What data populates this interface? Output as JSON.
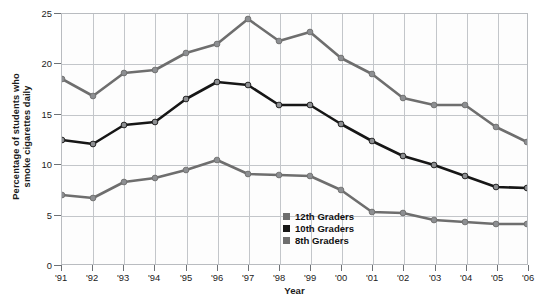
{
  "chart_data": {
    "type": "line",
    "title": "",
    "xlabel": "Year",
    "ylabel_line1": "Percentage of students who",
    "ylabel_line2": "smoke cigarettes daily",
    "ylabel": "Percentage of students who smoke cigarettes daily",
    "categories": [
      "'91",
      "'92",
      "'93",
      "'94",
      "'95",
      "'96",
      "'97",
      "'98",
      "'99",
      "'00",
      "'01",
      "'02",
      "'03",
      "'04",
      "'05",
      "'06"
    ],
    "xticklabels": [
      "'91",
      "'92",
      "'93",
      "'94",
      "'95",
      "'96",
      "'97",
      "'98",
      "'99",
      "'00",
      "'01",
      "'02",
      "'03",
      "'04",
      "'05",
      "'06"
    ],
    "yticklabels": [
      "0",
      "5",
      "10",
      "15",
      "20",
      "25"
    ],
    "yticks": [
      0,
      5,
      10,
      15,
      20,
      25
    ],
    "ylim": [
      0,
      25
    ],
    "grid": true,
    "legend_position": "inside-bottom-center",
    "series": [
      {
        "name": "12th Graders",
        "color": "#6e6e6e",
        "values": [
          18.5,
          16.8,
          19.1,
          19.4,
          21.1,
          22.0,
          24.5,
          22.3,
          23.2,
          20.6,
          19.0,
          16.6,
          15.9,
          15.9,
          13.7,
          12.2
        ]
      },
      {
        "name": "10th Graders",
        "color": "#161616",
        "values": [
          12.4,
          12.0,
          13.9,
          14.2,
          16.5,
          18.2,
          17.9,
          15.9,
          15.9,
          14.0,
          12.3,
          10.8,
          9.9,
          8.8,
          7.7,
          7.6
        ]
      },
      {
        "name": "8th Graders",
        "color": "#6e6e6e",
        "values": [
          6.9,
          6.6,
          8.2,
          8.6,
          9.4,
          10.4,
          9.0,
          8.9,
          8.8,
          7.4,
          5.2,
          5.1,
          4.4,
          4.2,
          4.0,
          4.0
        ]
      }
    ],
    "legend": [
      {
        "label": "12th Graders",
        "color": "#6e6e6e"
      },
      {
        "label": "10th Graders",
        "color": "#161616"
      },
      {
        "label": "8th Graders",
        "color": "#6e6e6e"
      }
    ],
    "colors": {
      "grid": "#c3c6ca",
      "frame": "#b9bcc0",
      "axis_text": "#1b1b1b",
      "background": "#ffffff",
      "plot_background": "#fdfdfd"
    }
  }
}
